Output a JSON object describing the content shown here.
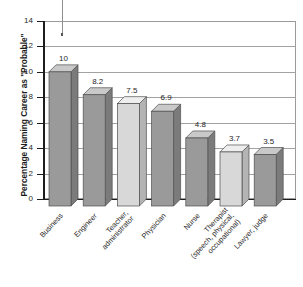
{
  "chart_data": {
    "type": "bar",
    "title": "",
    "xlabel": "",
    "ylabel": "Percentage Naming Career as \"Probable\"",
    "ylim": [
      0,
      14
    ],
    "ytick_labels": [
      "0",
      "2",
      "4",
      "6",
      "8",
      "10",
      "12",
      "14"
    ],
    "ytick_values": [
      0,
      2,
      4,
      6,
      8,
      10,
      12,
      14
    ],
    "grid": true,
    "legend": "none",
    "style": "3d-bar",
    "categories": [
      "Business",
      "Engineer",
      "Teacher, administrator",
      "Physician",
      "Nurse",
      "Therapist (speech, physical, occupational)",
      "Lawyer, judge"
    ],
    "category_lines": [
      [
        "Business"
      ],
      [
        "Engineer"
      ],
      [
        "Teacher,",
        "administrator"
      ],
      [
        "Physician"
      ],
      [
        "Nurse"
      ],
      [
        "Therapist",
        "(speech, physical,",
        "occupational)"
      ],
      [
        "Lawyer, judge"
      ]
    ],
    "values": [
      10,
      8.2,
      7.5,
      6.9,
      4.8,
      3.7,
      3.5
    ],
    "value_labels": [
      "10",
      "8.2",
      "7.5",
      "6.9",
      "4.8",
      "3.7",
      "3.5"
    ],
    "bar_shades": [
      "dark",
      "dark",
      "light",
      "dark",
      "dark",
      "light",
      "dark"
    ],
    "colors": {
      "bar_dark_front": "#9a9a9a",
      "bar_dark_top": "#c9c9c9",
      "bar_dark_side": "#7b7b7b",
      "bar_light_front": "#d8d8d8",
      "bar_light_top": "#eeeeee",
      "bar_light_side": "#b4b4b4",
      "gridline": "#a2a2a2",
      "axis": "#1d1d1d",
      "frame": "#9b9b9b",
      "text": "#1f1f1f",
      "background": "#ffffff"
    }
  }
}
